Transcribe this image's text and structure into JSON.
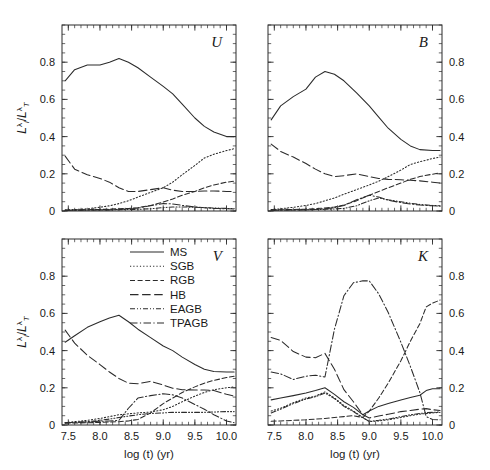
{
  "figure": {
    "xlabel": "log (t) (yr)",
    "ylabel_parts": {
      "num": "L",
      "num_sub": "i",
      "num_sup": "λ",
      "den": "L",
      "den_sub": "T",
      "den_sup": "λ",
      "slash": "/"
    },
    "ylabel_text": "L_i^λ / L_T^λ",
    "xticks": [
      "7.5",
      "8.0",
      "8.5",
      "9.0",
      "9.5",
      "10.0"
    ],
    "yticks": [
      "0",
      "0.2",
      "0.4",
      "0.6",
      "0.8"
    ],
    "line_color": "#2b2b2b",
    "background": "#ffffff"
  },
  "legend": {
    "position": "upper-center-of-V-panel",
    "entries": [
      {
        "label": "MS",
        "style": "solid"
      },
      {
        "label": "SGB",
        "style": "dotted"
      },
      {
        "label": "RGB",
        "style": "dashed"
      },
      {
        "label": "HB",
        "style": "long-dash"
      },
      {
        "label": "EAGB",
        "style": "dash-dot-dot"
      },
      {
        "label": "TPAGB",
        "style": "dash-dot"
      }
    ]
  },
  "chart_data": {
    "type": "line",
    "title": "",
    "xlabel": "log (t) (yr)",
    "ylabel": "L_i^λ / L_T^λ",
    "xlim": [
      7.4,
      10.15
    ],
    "ylim": [
      0,
      1.0
    ],
    "grid": false,
    "panels": [
      {
        "name": "U",
        "position": "top-left",
        "yaxis_side": "left",
        "x": [
          7.45,
          7.6,
          7.8,
          8.0,
          8.15,
          8.3,
          8.45,
          8.6,
          8.8,
          9.0,
          9.15,
          9.3,
          9.5,
          9.65,
          9.8,
          10.0,
          10.12
        ],
        "series": [
          {
            "name": "MS",
            "values": [
              0.7,
              0.76,
              0.785,
              0.785,
              0.8,
              0.82,
              0.8,
              0.77,
              0.72,
              0.67,
              0.63,
              0.575,
              0.5,
              0.455,
              0.425,
              0.4,
              0.4
            ]
          },
          {
            "name": "SGB",
            "values": [
              0.005,
              0.008,
              0.012,
              0.02,
              0.028,
              0.04,
              0.055,
              0.075,
              0.1,
              0.125,
              0.155,
              0.195,
              0.245,
              0.285,
              0.305,
              0.325,
              0.335
            ]
          },
          {
            "name": "RGB",
            "values": [
              0.005,
              0.006,
              0.007,
              0.008,
              0.01,
              0.012,
              0.014,
              0.018,
              0.03,
              0.048,
              0.065,
              0.085,
              0.105,
              0.125,
              0.14,
              0.155,
              0.16
            ]
          },
          {
            "name": "HB",
            "values": [
              0.295,
              0.225,
              0.195,
              0.175,
              0.155,
              0.125,
              0.105,
              0.105,
              0.115,
              0.125,
              0.112,
              0.105,
              0.105,
              0.108,
              0.108,
              0.105,
              0.105
            ]
          },
          {
            "name": "EAGB",
            "values": [
              0.004,
              0.004,
              0.005,
              0.006,
              0.006,
              0.007,
              0.008,
              0.009,
              0.012,
              0.018,
              0.022,
              0.022,
              0.02,
              0.018,
              0.016,
              0.014,
              0.013
            ]
          },
          {
            "name": "TPAGB",
            "values": [
              0.003,
              0.004,
              0.005,
              0.005,
              0.006,
              0.008,
              0.012,
              0.016,
              0.028,
              0.04,
              0.038,
              0.03,
              0.022,
              0.018,
              0.014,
              0.012,
              0.011
            ]
          }
        ]
      },
      {
        "name": "B",
        "position": "top-right",
        "yaxis_side": "right",
        "x": [
          7.45,
          7.6,
          7.8,
          8.0,
          8.15,
          8.3,
          8.45,
          8.6,
          8.8,
          9.0,
          9.15,
          9.3,
          9.5,
          9.65,
          9.8,
          10.0,
          10.12
        ],
        "series": [
          {
            "name": "MS",
            "values": [
              0.49,
              0.565,
              0.615,
              0.655,
              0.72,
              0.75,
              0.735,
              0.7,
              0.635,
              0.565,
              0.505,
              0.445,
              0.385,
              0.35,
              0.33,
              0.325,
              0.325
            ]
          },
          {
            "name": "SGB",
            "values": [
              0.008,
              0.012,
              0.02,
              0.03,
              0.04,
              0.055,
              0.07,
              0.09,
              0.115,
              0.14,
              0.16,
              0.185,
              0.22,
              0.25,
              0.265,
              0.282,
              0.29
            ]
          },
          {
            "name": "RGB",
            "values": [
              0.006,
              0.007,
              0.008,
              0.01,
              0.013,
              0.016,
              0.022,
              0.032,
              0.055,
              0.085,
              0.105,
              0.125,
              0.15,
              0.17,
              0.185,
              0.198,
              0.205
            ]
          },
          {
            "name": "HB",
            "values": [
              0.36,
              0.32,
              0.29,
              0.255,
              0.225,
              0.2,
              0.185,
              0.19,
              0.2,
              0.185,
              0.175,
              0.17,
              0.168,
              0.165,
              0.162,
              0.155,
              0.15
            ]
          },
          {
            "name": "EAGB",
            "values": [
              0.005,
              0.005,
              0.006,
              0.007,
              0.008,
              0.009,
              0.011,
              0.014,
              0.028,
              0.055,
              0.07,
              0.06,
              0.05,
              0.042,
              0.035,
              0.03,
              0.028
            ]
          },
          {
            "name": "TPAGB",
            "values": [
              0.004,
              0.005,
              0.005,
              0.006,
              0.008,
              0.012,
              0.018,
              0.03,
              0.06,
              0.085,
              0.075,
              0.058,
              0.045,
              0.038,
              0.032,
              0.028,
              0.026
            ]
          }
        ]
      },
      {
        "name": "V",
        "position": "bottom-left",
        "yaxis_side": "left",
        "x": [
          7.45,
          7.6,
          7.8,
          8.0,
          8.15,
          8.3,
          8.45,
          8.6,
          8.8,
          9.0,
          9.15,
          9.3,
          9.5,
          9.65,
          9.8,
          10.0,
          10.12
        ],
        "series": [
          {
            "name": "MS",
            "values": [
              0.445,
              0.48,
              0.525,
              0.555,
              0.575,
              0.59,
              0.555,
              0.515,
              0.47,
              0.425,
              0.4,
              0.365,
              0.325,
              0.3,
              0.288,
              0.285,
              0.285
            ]
          },
          {
            "name": "SGB",
            "values": [
              0.012,
              0.018,
              0.025,
              0.035,
              0.045,
              0.055,
              0.06,
              0.065,
              0.07,
              0.082,
              0.1,
              0.125,
              0.155,
              0.175,
              0.19,
              0.2,
              0.205
            ]
          },
          {
            "name": "RGB",
            "values": [
              0.01,
              0.011,
              0.012,
              0.014,
              0.016,
              0.018,
              0.022,
              0.03,
              0.065,
              0.115,
              0.145,
              0.175,
              0.205,
              0.225,
              0.24,
              0.255,
              0.262
            ]
          },
          {
            "name": "HB",
            "values": [
              0.51,
              0.44,
              0.375,
              0.325,
              0.285,
              0.25,
              0.225,
              0.222,
              0.235,
              0.215,
              0.198,
              0.19,
              0.188,
              0.188,
              0.185,
              0.165,
              0.155
            ]
          },
          {
            "name": "EAGB",
            "values": [
              0.012,
              0.014,
              0.018,
              0.025,
              0.032,
              0.04,
              0.048,
              0.055,
              0.062,
              0.065,
              0.068,
              0.068,
              0.068,
              0.068,
              0.07,
              0.072,
              0.072
            ]
          },
          {
            "name": "TPAGB",
            "values": [
              0.012,
              0.014,
              0.016,
              0.02,
              0.022,
              0.025,
              0.09,
              0.145,
              0.158,
              0.168,
              0.162,
              0.145,
              0.11,
              0.085,
              0.055,
              0.022,
              0.012
            ]
          }
        ]
      },
      {
        "name": "K",
        "position": "bottom-right",
        "yaxis_side": "right",
        "x": [
          7.45,
          7.6,
          7.8,
          8.0,
          8.15,
          8.3,
          8.45,
          8.6,
          8.75,
          8.9,
          9.0,
          9.15,
          9.3,
          9.5,
          9.65,
          9.8,
          9.9,
          10.0,
          10.12
        ],
        "series": [
          {
            "name": "MS",
            "values": [
              0.135,
              0.145,
              0.158,
              0.172,
              0.185,
              0.2,
              0.165,
              0.125,
              0.095,
              0.055,
              0.075,
              0.1,
              0.115,
              0.135,
              0.148,
              0.16,
              0.185,
              0.195,
              0.195
            ]
          },
          {
            "name": "SGB",
            "values": [
              0.075,
              0.09,
              0.12,
              0.145,
              0.155,
              0.178,
              0.145,
              0.105,
              0.075,
              0.04,
              0.018,
              0.022,
              0.028,
              0.04,
              0.05,
              0.058,
              0.062,
              0.065,
              0.068
            ]
          },
          {
            "name": "RGB",
            "values": [
              0.02,
              0.022,
              0.025,
              0.028,
              0.032,
              0.035,
              0.04,
              0.045,
              0.05,
              0.04,
              0.075,
              0.145,
              0.225,
              0.345,
              0.45,
              0.545,
              0.635,
              0.655,
              0.672
            ]
          },
          {
            "name": "HB",
            "values": [
              0.47,
              0.455,
              0.395,
              0.365,
              0.362,
              0.385,
              0.3,
              0.19,
              0.125,
              0.055,
              0.038,
              0.048,
              0.058,
              0.072,
              0.078,
              0.085,
              0.088,
              0.082,
              0.078
            ]
          },
          {
            "name": "EAGB",
            "values": [
              0.065,
              0.085,
              0.115,
              0.14,
              0.152,
              0.172,
              0.142,
              0.1,
              0.072,
              0.038,
              0.02,
              0.025,
              0.032,
              0.045,
              0.055,
              0.062,
              0.066,
              0.068,
              0.07
            ]
          },
          {
            "name": "TPAGB",
            "values": [
              0.285,
              0.275,
              0.245,
              0.262,
              0.268,
              0.258,
              0.515,
              0.695,
              0.765,
              0.775,
              0.775,
              0.705,
              0.605,
              0.445,
              0.315,
              0.175,
              0.045,
              0.03,
              0.028
            ]
          }
        ]
      }
    ]
  }
}
